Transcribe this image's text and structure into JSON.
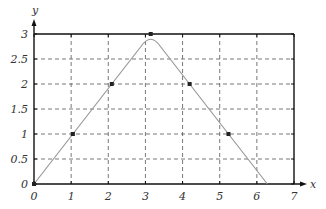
{
  "chart_data": {
    "type": "line",
    "title": "",
    "xlabel": "x",
    "ylabel": "y",
    "xlim": [
      0,
      7
    ],
    "ylim": [
      0,
      3
    ],
    "grid": true,
    "grid_style": "dashed",
    "x_ticks": [
      "0",
      "1",
      "2",
      "3",
      "4",
      "5",
      "6",
      "7"
    ],
    "y_ticks": [
      "0",
      "0.5",
      "1",
      "1.5",
      "2",
      "2.5",
      "3"
    ],
    "series": [
      {
        "name": "curve",
        "style": "line",
        "color": "#999999",
        "x": [
          0,
          1.047,
          2.094,
          3.142,
          4.189,
          5.236,
          6.283
        ],
        "y": [
          0,
          1,
          2,
          3,
          2,
          1,
          0
        ]
      },
      {
        "name": "marked points",
        "style": "markers",
        "color": "#222222",
        "x": [
          0,
          1.047,
          2.094,
          3.142,
          4.189,
          5.236
        ],
        "y": [
          0,
          1,
          2,
          3,
          2,
          1
        ]
      }
    ]
  }
}
